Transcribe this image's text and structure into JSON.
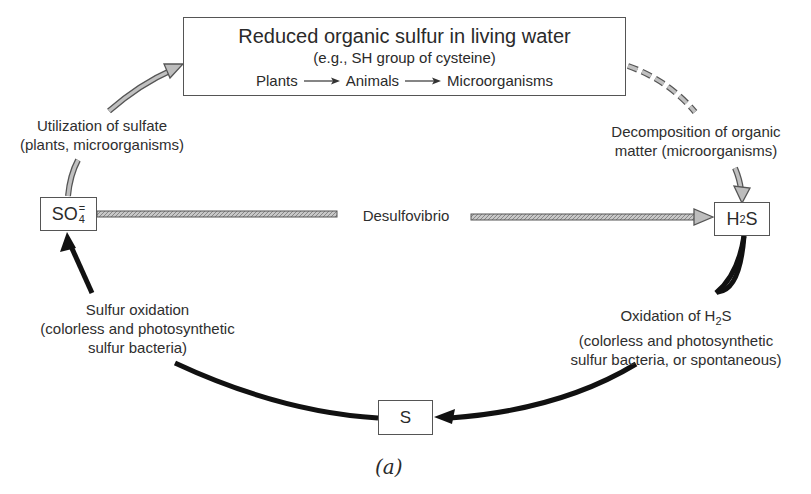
{
  "diagram": {
    "top_box": {
      "title": "Reduced organic sulfur in living water",
      "subtitle": "(e.g., SH group of cysteine)",
      "chain": [
        "Plants",
        "Animals",
        "Microorganisms"
      ]
    },
    "nodes": {
      "so4": {
        "main": "SO",
        "sub": "4",
        "sup": "="
      },
      "h2s": {
        "pre": "H",
        "sub": "2",
        "post": "S"
      },
      "s": {
        "label": "S"
      }
    },
    "labels": {
      "utilization_line1": "Utilization of sulfate",
      "utilization_line2": "(plants, microorganisms)",
      "decomposition_line1": "Decomposition of organic",
      "decomposition_line2": "matter (microorganisms)",
      "desulfovibrio": "Desulfovibrio",
      "sulfur_oxidation_line1": "Sulfur oxidation",
      "sulfur_oxidation_line2": "(colorless and photosynthetic",
      "sulfur_oxidation_line3": "sulfur bacteria)",
      "h2s_oxidation_line1_pre": "Oxidation of H",
      "h2s_oxidation_line1_sub": "2",
      "h2s_oxidation_line1_post": "S",
      "h2s_oxidation_line2": "(colorless and photosynthetic",
      "h2s_oxidation_line3": "sulfur bacteria, or spontaneous)"
    },
    "caption": "(a)",
    "colors": {
      "outline_arrow_fill": "#b8b8b8",
      "outline_arrow_stroke": "#555555",
      "solid_arrow": "#111111",
      "box_border": "#555555",
      "text": "#2e2e2e"
    }
  }
}
